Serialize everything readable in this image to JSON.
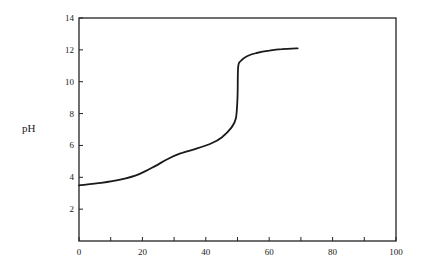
{
  "chart_data": {
    "type": "line",
    "title": "",
    "xlabel": "",
    "ylabel": "pH",
    "xlim": [
      0,
      100
    ],
    "ylim": [
      0,
      14
    ],
    "grid": false,
    "legend": null,
    "x_ticks": [
      0,
      20,
      40,
      60,
      80,
      100
    ],
    "x_minor_ticks": [
      10,
      30,
      50,
      70,
      90
    ],
    "y_ticks": [
      2,
      4,
      6,
      8,
      10,
      12,
      14
    ],
    "x_tick_labels": [
      "0",
      "20",
      "40",
      "60",
      "80",
      "100"
    ],
    "y_tick_labels": [
      "2",
      "4",
      "6",
      "8",
      "10",
      "12",
      "14"
    ],
    "y_zero_label": "0",
    "series": [
      {
        "name": "pH",
        "color": "#1a1a1a",
        "x": [
          0,
          7,
          13,
          19,
          24,
          28,
          32,
          37,
          42,
          45,
          48,
          49.5,
          50,
          50.2,
          51,
          53,
          56,
          60,
          64,
          69
        ],
        "y": [
          3.5,
          3.65,
          3.85,
          4.2,
          4.7,
          5.15,
          5.5,
          5.8,
          6.15,
          6.5,
          7.1,
          7.7,
          9.0,
          10.9,
          11.3,
          11.6,
          11.8,
          11.95,
          12.05,
          12.1
        ]
      }
    ]
  }
}
